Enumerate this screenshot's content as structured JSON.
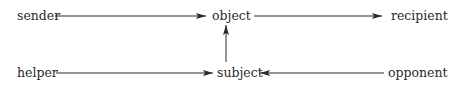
{
  "diagram": {
    "type": "actantial-model",
    "nodes": {
      "sender": "sender",
      "object": "object",
      "recipient": "recipient",
      "helper": "helper",
      "subject": "subject",
      "opponent": "opponent"
    },
    "edges": [
      {
        "from": "sender",
        "to": "object"
      },
      {
        "from": "object",
        "to": "recipient"
      },
      {
        "from": "helper",
        "to": "subject"
      },
      {
        "from": "subject",
        "to": "object"
      },
      {
        "from": "opponent",
        "to": "subject"
      }
    ],
    "colors": {
      "text": "#2a2a2a",
      "arrow": "#2a2a2a",
      "background": "#ffffff"
    }
  }
}
